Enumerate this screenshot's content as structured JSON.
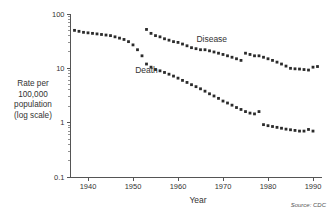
{
  "chart_data": {
    "type": "scatter",
    "title": "",
    "xlabel": "Year",
    "ylabel": "Rate per 100,000 population (log scale)",
    "ylabel_lines": [
      "Rate per",
      "100,000",
      "population",
      "(log scale)"
    ],
    "yscale": "log",
    "ylim": [
      0.1,
      100
    ],
    "xlim": [
      1936,
      1992
    ],
    "ytick_labels": [
      "100",
      "10",
      "1",
      "0.1"
    ],
    "ytick_values": [
      100,
      10,
      1,
      0.1
    ],
    "xtick_labels": [
      "1940",
      "1950",
      "1960",
      "1970",
      "1980",
      "1990"
    ],
    "xtick_values": [
      1940,
      1950,
      1960,
      1970,
      1980,
      1990
    ],
    "grid": false,
    "legend_position": "inline-annotations",
    "annotations": [
      {
        "text": "Disease",
        "x": 1967.5,
        "y": 30.0
      },
      {
        "text": "Death",
        "x": 1953.0,
        "y": 8.2
      }
    ],
    "source_note": "Source: CDC",
    "series": [
      {
        "name": "Disease",
        "marker": "square",
        "x": [
          1953,
          1954,
          1955,
          1956,
          1957,
          1958,
          1959,
          1960,
          1961,
          1962,
          1963,
          1964,
          1965,
          1966,
          1967,
          1968,
          1969,
          1970,
          1971,
          1972,
          1973,
          1974,
          1975,
          1976,
          1977,
          1978,
          1979,
          1980,
          1981,
          1982,
          1983,
          1984,
          1985,
          1986,
          1987,
          1988,
          1989,
          1990,
          1991
        ],
        "values": [
          52,
          44,
          40,
          38,
          35,
          33,
          31,
          30,
          28,
          26,
          24,
          23,
          22,
          22,
          21,
          20,
          19,
          18,
          17,
          16,
          15,
          14,
          19,
          18,
          17,
          17,
          16,
          15,
          14,
          13,
          12,
          11,
          10,
          9.8,
          9.7,
          9.5,
          9.3,
          10.5,
          10.8
        ]
      },
      {
        "name": "Death",
        "marker": "square",
        "x": [
          1937,
          1938,
          1939,
          1940,
          1941,
          1942,
          1943,
          1944,
          1945,
          1946,
          1947,
          1948,
          1949,
          1950,
          1951,
          1952,
          1953,
          1954,
          1955,
          1956,
          1957,
          1958,
          1959,
          1960,
          1961,
          1962,
          1963,
          1964,
          1965,
          1966,
          1967,
          1968,
          1969,
          1970,
          1971,
          1972,
          1973,
          1974,
          1975,
          1976,
          1977,
          1978,
          1979,
          1980,
          1981,
          1982,
          1983,
          1984,
          1985,
          1986,
          1987,
          1988,
          1989,
          1990
        ],
        "values": [
          50,
          48,
          46,
          45,
          44,
          43,
          42,
          41,
          40,
          38,
          36,
          34,
          31,
          27,
          22,
          17,
          12,
          10.5,
          9.5,
          9,
          8.4,
          7.8,
          7.2,
          6.6,
          6.0,
          5.5,
          5.0,
          4.6,
          4.2,
          3.8,
          3.4,
          3.1,
          2.8,
          2.5,
          2.3,
          2.1,
          1.9,
          1.75,
          1.6,
          1.5,
          1.45,
          1.6,
          0.92,
          0.88,
          0.85,
          0.82,
          0.79,
          0.76,
          0.74,
          0.72,
          0.7,
          0.7,
          0.75,
          0.7
        ]
      }
    ]
  }
}
